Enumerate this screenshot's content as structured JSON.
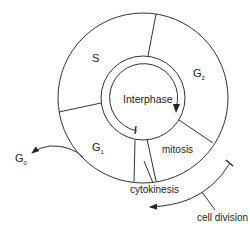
{
  "diagram": {
    "type": "cell-cycle",
    "center_label": "Interphase",
    "phases": [
      {
        "id": "S",
        "label": "S",
        "sub": ""
      },
      {
        "id": "G2",
        "label": "G",
        "sub": "2"
      },
      {
        "id": "mitosis",
        "label": "mitosis",
        "sub": ""
      },
      {
        "id": "cytokinesis",
        "label": "cytokinesis",
        "sub": ""
      },
      {
        "id": "G1",
        "label": "G",
        "sub": "1"
      }
    ],
    "exit_state": {
      "label": "G",
      "sub": "0"
    },
    "annotation": {
      "label": "cell division"
    },
    "colors": {
      "stroke": "#333333",
      "text": "#222222",
      "background": "#ffffff"
    }
  }
}
